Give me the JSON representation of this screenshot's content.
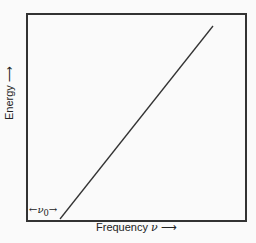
{
  "diagram": {
    "type": "line",
    "x_axis": {
      "label": "Frequency",
      "symbol": "ν",
      "arrow": "⟶"
    },
    "y_axis": {
      "label": "Energy",
      "arrow": "⟶"
    },
    "threshold": {
      "label_left_arrow": "←",
      "symbol": "ν",
      "subscript": "0",
      "label_right_arrow": "→"
    },
    "line": {
      "description": "linear increase of energy with frequency beyond threshold ν0",
      "start": [
        60,
        220
      ],
      "end": [
        213,
        26
      ],
      "color": "#333333"
    }
  }
}
